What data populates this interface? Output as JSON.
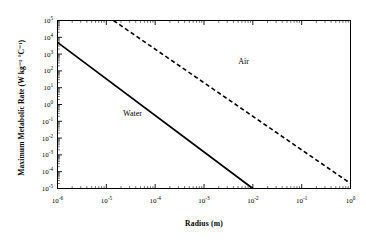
{
  "chart_data": {
    "type": "line",
    "title": "",
    "xlabel": "Radius (m)",
    "ylabel": "Maximum Metabolic Rate (W kg⁻¹ °C⁻¹)",
    "xscale": "log",
    "yscale": "log",
    "xlim": [
      1e-06,
      1.0
    ],
    "ylim": [
      1e-05,
      100000.0
    ],
    "grid": false,
    "legend_position": "inline-annotation",
    "xticks": [
      {
        "value": 1e-06,
        "mantissa": "10",
        "exponent": "-6",
        "label": "10-6"
      },
      {
        "value": 1e-05,
        "mantissa": "10",
        "exponent": "-5",
        "label": "10-5"
      },
      {
        "value": 0.0001,
        "mantissa": "10",
        "exponent": "-4",
        "label": "10-4"
      },
      {
        "value": 0.001,
        "mantissa": "10",
        "exponent": "-3",
        "label": "10-3"
      },
      {
        "value": 0.01,
        "mantissa": "10",
        "exponent": "-2",
        "label": "10-2"
      },
      {
        "value": 0.1,
        "mantissa": "10",
        "exponent": "-1",
        "label": "10-1"
      },
      {
        "value": 1.0,
        "mantissa": "10",
        "exponent": "0",
        "label": "100"
      }
    ],
    "yticks": [
      {
        "value": 100000.0,
        "mantissa": "10",
        "exponent": "5",
        "label": "105"
      },
      {
        "value": 10000.0,
        "mantissa": "10",
        "exponent": "4",
        "label": "104"
      },
      {
        "value": 1000.0,
        "mantissa": "10",
        "exponent": "3",
        "label": "103"
      },
      {
        "value": 100.0,
        "mantissa": "10",
        "exponent": "2",
        "label": "102"
      },
      {
        "value": 10.0,
        "mantissa": "10",
        "exponent": "1",
        "label": "101"
      },
      {
        "value": 1.0,
        "mantissa": "10",
        "exponent": "0",
        "label": "100"
      },
      {
        "value": 0.1,
        "mantissa": "10",
        "exponent": "-1",
        "label": "10-1"
      },
      {
        "value": 0.01,
        "mantissa": "10",
        "exponent": "-2",
        "label": "10-2"
      },
      {
        "value": 0.001,
        "mantissa": "10",
        "exponent": "-3",
        "label": "10-3"
      },
      {
        "value": 0.0001,
        "mantissa": "10",
        "exponent": "-4",
        "label": "10-4"
      },
      {
        "value": 1e-05,
        "mantissa": "10",
        "exponent": "-5",
        "label": "10-5"
      }
    ],
    "series": [
      {
        "name": "Water",
        "style": "solid",
        "color": "#000000",
        "annotation": "Water",
        "x": [
          1e-06,
          0.01
        ],
        "y": [
          5000,
          1e-05
        ],
        "slope_per_decade": -2.17
      },
      {
        "name": "Air",
        "style": "dashed",
        "color": "#000000",
        "annotation": "Air",
        "x": [
          1.4e-05,
          1.0
        ],
        "y": [
          100000.0,
          2e-05
        ],
        "slope_per_decade": -2.0
      }
    ],
    "annotations": [
      {
        "text": "Air",
        "x": 0.005,
        "y": 300.0
      },
      {
        "text": "Water",
        "x": 2.2e-05,
        "y": 0.25
      }
    ]
  },
  "figure": {
    "background": "#ffffff",
    "frame_color": "#000000",
    "text_color": "#000000"
  }
}
